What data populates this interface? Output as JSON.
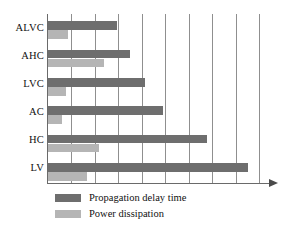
{
  "chart_data": {
    "type": "bar",
    "orientation": "horizontal",
    "title": "",
    "subtitle": "",
    "xlabel": "",
    "ylabel": "",
    "categories": [
      "ALVC",
      "AHC",
      "LVC",
      "AC",
      "HC",
      "LV"
    ],
    "series": [
      {
        "name": "Propagation delay time",
        "color": "#6e6e6e",
        "values": [
          2.93,
          3.48,
          4.15,
          4.88,
          6.76,
          8.5
        ]
      },
      {
        "name": "Power dissipation",
        "color": "#b5b5b5",
        "values": [
          0.87,
          2.39,
          0.78,
          0.61,
          2.16,
          1.64
        ]
      }
    ],
    "xlim": [
      0,
      9.2
    ],
    "x_tick_labels": [],
    "gridlines": [
      1,
      2,
      3,
      4,
      5,
      6,
      7,
      8,
      9
    ],
    "grid": true,
    "grid_color": "#8f8f8f",
    "axis_color": "#6a6a6a",
    "axis_arrow": true,
    "legend_position": "bottom-left",
    "background": "#ffffff"
  },
  "legend": {
    "items": [
      {
        "label": "Propagation delay time",
        "swatch": "dark"
      },
      {
        "label": "Power dissipation",
        "swatch": "light"
      }
    ]
  },
  "axis": {
    "category_labels": [
      "ALVC",
      "AHC",
      "LVC",
      "AC",
      "HC",
      "LV"
    ]
  }
}
